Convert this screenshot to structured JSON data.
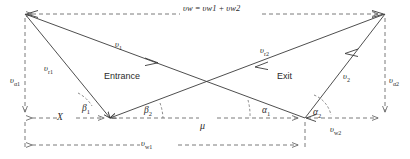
{
  "diagram": {
    "regions": {
      "entrance_label": "Entrance",
      "exit_label": "Exit"
    },
    "equation_label": "υw = υw1 + υw2",
    "labels": {
      "v_w_total": {
        "base": "υ",
        "sub": "w"
      },
      "v_w1": {
        "base": "υ",
        "sub": "w1"
      },
      "v_w2": {
        "base": "υ",
        "sub": "w2"
      },
      "v_a1": {
        "base": "υ",
        "sub": "α1"
      },
      "v_a2": {
        "base": "υ",
        "sub": "α2"
      },
      "v_r1": {
        "base": "υ",
        "sub": "r1"
      },
      "v_r2": {
        "base": "υ",
        "sub": "r2"
      },
      "v_1": {
        "base": "υ",
        "sub": "1"
      },
      "v_2": {
        "base": "υ",
        "sub": "2"
      },
      "mu": {
        "base": "μ",
        "sub": ""
      },
      "x_offset": {
        "base": "X",
        "sub": ""
      }
    },
    "angles": {
      "beta_1": {
        "base": "β",
        "sub": "1"
      },
      "beta_2": {
        "base": "β",
        "sub": "2"
      },
      "alpha_1": {
        "base": "α",
        "sub": "1"
      },
      "alpha_2": {
        "base": "α",
        "sub": "2"
      }
    },
    "colors": {
      "solid_stroke": "#3a3a3a",
      "dashed_stroke": "#6b6b6b",
      "text": "#2b2b2b",
      "background": "#ffffff"
    },
    "geometry": {
      "top_left": [
        25,
        14
      ],
      "top_right": [
        385,
        14
      ],
      "bottom_left": [
        110,
        118
      ],
      "bottom_right": [
        305,
        118
      ],
      "baseline_left": [
        25,
        118
      ],
      "baseline_right": [
        385,
        118
      ],
      "bottom_dim_y": 145,
      "crossing_point": [
        207,
        83
      ]
    }
  }
}
